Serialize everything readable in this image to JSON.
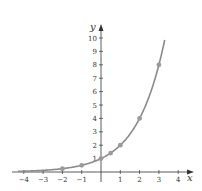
{
  "chart_data": {
    "type": "line",
    "title": "",
    "xlabel": "x",
    "ylabel": "y",
    "function": "y = 2^x",
    "xlim": [
      -4.3,
      4.8
    ],
    "ylim": [
      0,
      10.5
    ],
    "x_ticks": [
      -4,
      -3,
      -2,
      -1,
      1,
      2,
      3,
      4
    ],
    "y_ticks": [
      1,
      2,
      3,
      4,
      5,
      6,
      7,
      8,
      9,
      10
    ],
    "grid": false,
    "legend": null,
    "series": [
      {
        "name": "curve",
        "x": [
          -4,
          -3,
          -2,
          -1,
          0,
          1,
          2,
          3,
          3.32
        ],
        "y": [
          0.0625,
          0.125,
          0.25,
          0.5,
          1,
          2,
          4,
          8,
          10
        ],
        "color": "#8a8a8a"
      },
      {
        "name": "points",
        "x": [
          -2,
          -1,
          0,
          0.5,
          1,
          2,
          3
        ],
        "y": [
          0.25,
          0.5,
          1,
          1.41,
          2,
          4,
          8
        ],
        "color": "#9a9a9a"
      }
    ]
  },
  "colors": {
    "axis": "#333333",
    "curve": "#8a8a8a",
    "point": "#9a9a9a"
  }
}
